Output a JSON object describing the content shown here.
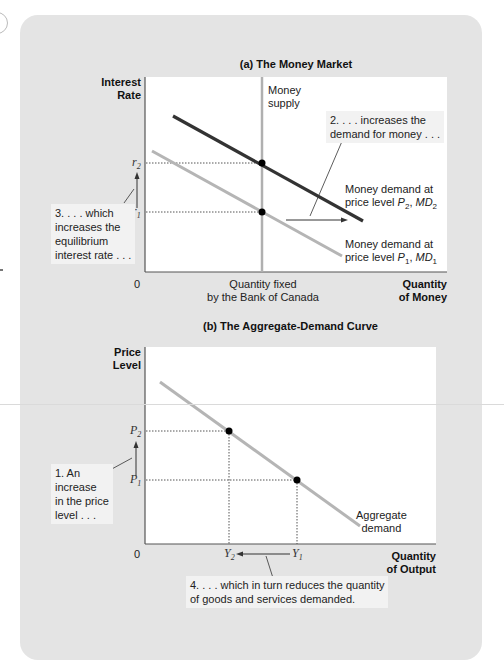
{
  "panel_a": {
    "title": "(a) The Money Market",
    "y_axis_label_1": "Interest",
    "y_axis_label_2": "Rate",
    "x_axis_label_1": "Quantity",
    "x_axis_label_2": "of Money",
    "origin": "0",
    "money_supply_label_1": "Money",
    "money_supply_label_2": "supply",
    "quantity_fixed_1": "Quantity fixed",
    "quantity_fixed_2": "by the Bank of Canada",
    "tick_r2": "r",
    "tick_r2_sub": "2",
    "tick_r1": "r",
    "tick_r1_sub": "1",
    "md2_label_1": "Money demand at",
    "md2_label_2": "price level P2, MD2",
    "md1_label_1": "Money demand at",
    "md1_label_2": "price level P1, MD1",
    "note_2_line1": "2. . . . increases the",
    "note_2_line2": "demand for money . . .",
    "note_3_line1": "3. . . . which",
    "note_3_line2": "increases the",
    "note_3_line3": "equilibrium",
    "note_3_line4": "interest rate . . ."
  },
  "panel_b": {
    "title": "(b) The Aggregate-Demand Curve",
    "y_axis_label_1": "Price",
    "y_axis_label_2": "Level",
    "x_axis_label_1": "Quantity",
    "x_axis_label_2": "of Output",
    "origin": "0",
    "tick_p2": "P",
    "tick_p2_sub": "2",
    "tick_p1": "P",
    "tick_p1_sub": "1",
    "tick_y2": "Y",
    "tick_y2_sub": "2",
    "tick_y1": "Y",
    "tick_y1_sub": "1",
    "ad_label_1": "Aggregate",
    "ad_label_2": "demand",
    "note_1_line1": "1. An",
    "note_1_line2": "increase",
    "note_1_line3": "in the price",
    "note_1_line4": "level . . .",
    "note_4_line1": "4. . . . which in turn reduces the quantity",
    "note_4_line2": "of goods and services demanded."
  },
  "colors": {
    "panel_bg": "#e4e4e4",
    "plot_bg": "#ffffff",
    "md2_line": "#333333",
    "md1_line": "#b5b5b5",
    "money_supply_line": "#b0b0b0",
    "ad_line": "#b5b5b5",
    "point": "#000000"
  }
}
